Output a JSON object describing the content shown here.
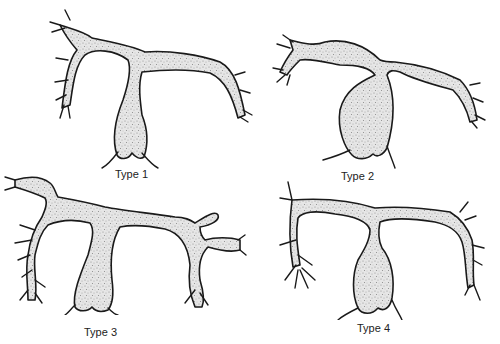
{
  "diagram": {
    "panels": [
      {
        "id": "type1",
        "label": "Type 1",
        "description": "Y-shaped branching with central elongated body, left and right curved arms with fimbriated ends"
      },
      {
        "id": "type2",
        "label": "Type 2",
        "description": "Broad bulbous central body with narrow arms joined at a single point"
      },
      {
        "id": "type3",
        "label": "Type 3",
        "description": "Wide T-shaped structure with long columnar central body and heavily branched ends"
      },
      {
        "id": "type4",
        "label": "Type 4",
        "description": "T-shaped with thin horizontal arms, small bulbous central body, branched terminal ends"
      }
    ],
    "colors": {
      "stroke": "#1a1a1a",
      "fill_stipple": "#9a9a9a",
      "background": "#ffffff"
    }
  }
}
